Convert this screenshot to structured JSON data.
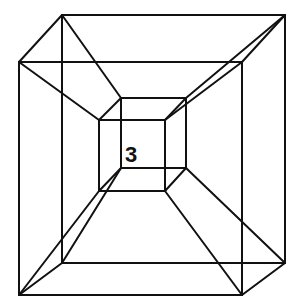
{
  "figure": {
    "type": "tesseract-wireframe",
    "label": "3",
    "colors": {
      "line": "#111111",
      "background": "#ffffff"
    },
    "vertices": {
      "outer_back": [
        [
          62,
          15
        ],
        [
          285,
          15
        ],
        [
          285,
          263
        ],
        [
          62,
          263
        ]
      ],
      "outer_front": [
        [
          19,
          62
        ],
        [
          242,
          62
        ],
        [
          242,
          295
        ],
        [
          19,
          295
        ]
      ],
      "inner_back": [
        [
          121,
          98
        ],
        [
          186,
          98
        ],
        [
          186,
          168
        ],
        [
          121,
          168
        ]
      ],
      "inner_front": [
        [
          99,
          120
        ],
        [
          165,
          120
        ],
        [
          165,
          191
        ],
        [
          99,
          191
        ]
      ]
    }
  }
}
